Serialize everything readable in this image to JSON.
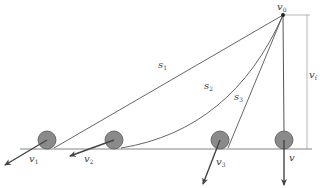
{
  "diagram": {
    "title": "",
    "colors": {
      "line": "#555555",
      "ball_fill": "#8a8a8a",
      "ball_stroke": "#555555",
      "arrow": "#444444",
      "ground": "#666666",
      "dimension": "#888888"
    },
    "labels": {
      "apex": {
        "base": "v",
        "sub": "0"
      },
      "path1": {
        "base": "s",
        "sub": "1"
      },
      "path2": {
        "base": "s",
        "sub": "2"
      },
      "path3": {
        "base": "s",
        "sub": "3"
      },
      "height": {
        "base": "v",
        "sub": "f"
      },
      "velocity1": {
        "base": "v",
        "sub": "1"
      },
      "velocity2": {
        "base": "v",
        "sub": "2"
      },
      "velocity3": {
        "base": "v",
        "sub": "3"
      },
      "velocity4": {
        "base": "v",
        "sub": ""
      }
    },
    "balls": [
      {
        "id": "ball-1",
        "path": "s1",
        "velocity_label": "v1"
      },
      {
        "id": "ball-2",
        "path": "s2",
        "velocity_label": "v2"
      },
      {
        "id": "ball-3",
        "path": "s3",
        "velocity_label": "v3"
      },
      {
        "id": "ball-4",
        "path": "vertical",
        "velocity_label": "v"
      }
    ]
  }
}
